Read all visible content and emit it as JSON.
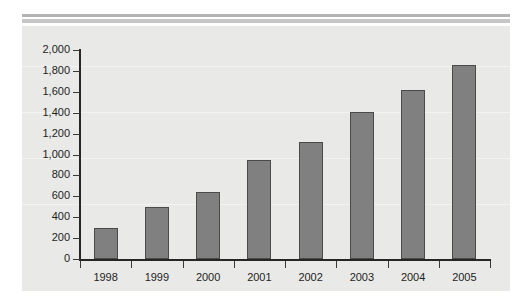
{
  "chart_data": {
    "type": "bar",
    "title": "",
    "xlabel": "",
    "ylabel": "",
    "categories": [
      "1998",
      "1999",
      "2000",
      "2001",
      "2002",
      "2003",
      "2004",
      "2005"
    ],
    "values": [
      300,
      500,
      645,
      950,
      1120,
      1410,
      1620,
      1860
    ],
    "series": [
      {
        "name": "",
        "values": [
          300,
          500,
          645,
          950,
          1120,
          1410,
          1620,
          1860
        ]
      }
    ],
    "ylim": [
      0,
      2000
    ],
    "ytick_step": 200,
    "ytick_labels": [
      "0",
      "200",
      "400",
      "600",
      "800",
      "1,000",
      "1,200",
      "1,400",
      "1,600",
      "1,800",
      "2,000"
    ],
    "ytick_values": [
      0,
      200,
      400,
      600,
      800,
      1000,
      1200,
      1400,
      1600,
      1800,
      2000
    ],
    "grid": false,
    "legend": null,
    "legend_position": "none",
    "annotations": []
  },
  "style": {
    "bar_fill": "#808080",
    "bar_border": "#4a4a4a",
    "panel_background": "#e9e9e7",
    "page_background": "#ffffff",
    "axis_color": "#262626",
    "tick_label_color": "#1e1e1e",
    "rule_color_top": "#b4b4b4",
    "rule_color_bottom": "#c6c6c6"
  }
}
